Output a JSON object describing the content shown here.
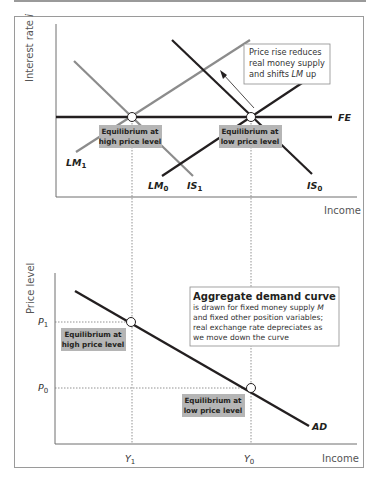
{
  "top_panel": {
    "y_axis_label": "Interest rate",
    "y_axis_symbol": "i",
    "x_axis_label": "Income",
    "curves": {
      "FE": "FE",
      "LM1": "LM",
      "LM1_sub": "1",
      "LM0": "LM",
      "LM0_sub": "0",
      "IS1": "IS",
      "IS1_sub": "1",
      "IS0": "IS",
      "IS0_sub": "0"
    },
    "annotation": {
      "line1": "Price rise reduces",
      "line2": "real money supply",
      "line3_prefix": "and shifts ",
      "line3_italic": "LM",
      "line3_suffix": " up"
    },
    "eq_high": {
      "line1": "Equilibrium at",
      "line2": "high price level"
    },
    "eq_low": {
      "line1": "Equilibrium at",
      "line2": "low price level"
    }
  },
  "bottom_panel": {
    "y_axis_label": "Price level",
    "x_axis_label": "Income",
    "P1": "P",
    "P1_sub": "1",
    "P0": "P",
    "P0_sub": "0",
    "Y1": "Y",
    "Y1_sub": "1",
    "Y0": "Y",
    "Y0_sub": "0",
    "curve_label": "AD",
    "eq_high": {
      "line1": "Equilibrium at",
      "line2": "high price level"
    },
    "eq_low": {
      "line1": "Equilibrium at",
      "line2": "low price level"
    },
    "legend": {
      "title": "Aggregate demand curve",
      "line1_prefix": "is drawn for fixed money supply ",
      "line1_italic": "M",
      "line2": "and fixed other position variables;",
      "line3": "real exchange rate depreciates as",
      "line4": "we move down the curve"
    }
  },
  "colors": {
    "dark_line": "#231f20",
    "gray_line": "#8c8c8c",
    "label_box": "#b5b5b5",
    "frame": "#9a9a9a",
    "axis": "#6e6e6e"
  }
}
